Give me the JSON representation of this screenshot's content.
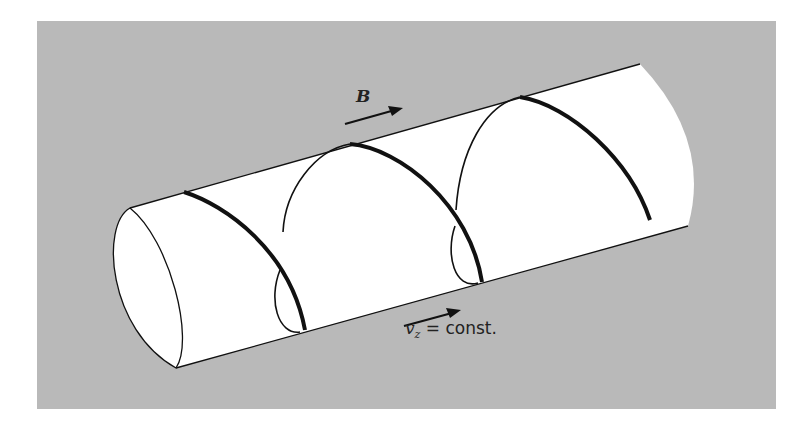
{
  "figure": {
    "colors": {
      "background": "#ffffff",
      "panel": "#b9b9b9",
      "cylinder": "#ffffff",
      "stroke": "#111111"
    },
    "labels": {
      "field": "B",
      "velocity_var": "v",
      "velocity_sub": "z",
      "velocity_rest": " = const."
    },
    "arrows": [
      {
        "name": "magnetic-field-arrow",
        "direction": "along cylinder axis"
      },
      {
        "name": "velocity-arrow",
        "direction": "along cylinder axis"
      }
    ]
  }
}
